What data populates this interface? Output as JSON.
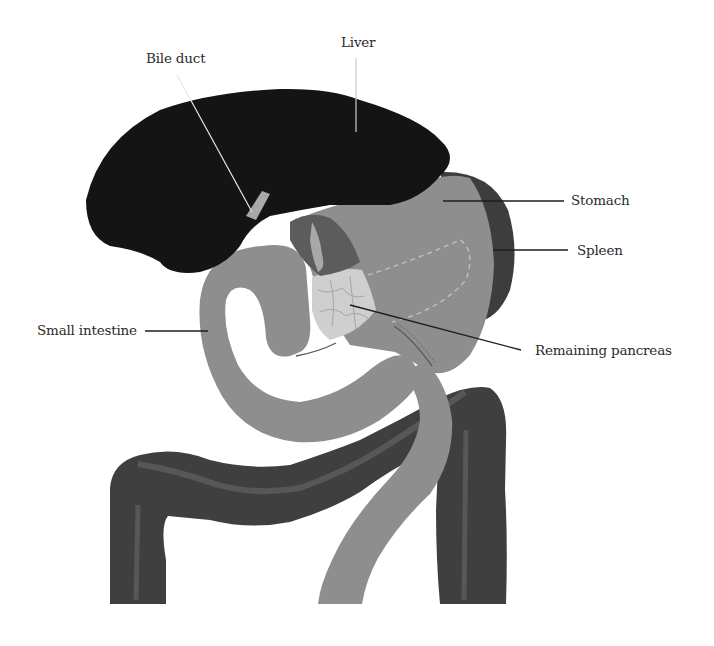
{
  "diagram": {
    "labels": {
      "liver": "Liver",
      "bile_duct": "Bile duct",
      "stomach": "Stomach",
      "spleen": "Spleen",
      "small_intestine": "Small intestine",
      "remaining_pancreas": "Remaining pancreas"
    },
    "colors": {
      "liver": "#141414",
      "stomach": "#8e8e8e",
      "spleen": "#3d3d3d",
      "small_intestine": "#8e8e8e",
      "large_intestine": "#3f3f3f",
      "large_intestine_band": "#5a5a5a",
      "pancreas": "#cfcfcf",
      "bile_duct": "#a8a8a8",
      "vessels": "#5c5c5c",
      "leader_line": "#1e1e1e",
      "label_text": "#2b2b2b",
      "background": "#ffffff"
    }
  }
}
